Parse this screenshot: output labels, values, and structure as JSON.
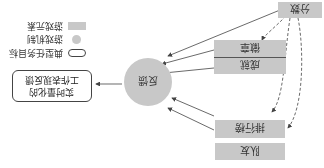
{
  "diagram": {
    "orientation": "rotated-180",
    "nodes": {
      "points": "分数",
      "badges": "徽章",
      "achievements": "成就",
      "leaderboard": "排行榜",
      "teammates": "队友",
      "feedback": "反馈",
      "goal_line1": "实时量化的",
      "goal_line2": "工作表现反馈"
    },
    "legend": {
      "goal": "典型任务目标",
      "mechanism": "游戏机制",
      "element": "游戏元素"
    },
    "colors": {
      "element_fill": "#c8c8c8",
      "mechanism_fill": "#c8c8c8",
      "line": "#444444"
    }
  }
}
